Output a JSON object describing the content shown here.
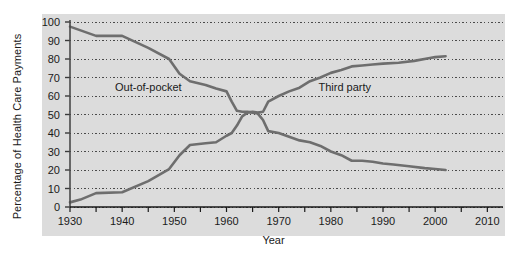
{
  "chart_data": {
    "type": "line",
    "title": "",
    "xlabel": "Year",
    "ylabel": "Percentage of Health Care Payments",
    "xlim": [
      1930,
      2013
    ],
    "ylim": [
      0,
      100
    ],
    "grid": true,
    "legend_position": "inline-annotation",
    "y_ticks": [
      0,
      10,
      20,
      30,
      40,
      50,
      60,
      70,
      80,
      90,
      100
    ],
    "y_tick_labels": [
      "0",
      "10",
      "20",
      "30",
      "40",
      "50",
      "60",
      "70",
      "80",
      "90",
      "100"
    ],
    "x_ticks": [
      1930,
      1935,
      1940,
      1945,
      1950,
      1955,
      1960,
      1965,
      1970,
      1975,
      1980,
      1985,
      1990,
      1995,
      2000,
      2005,
      2010
    ],
    "x_tick_labels_major": [
      "1930",
      "1940",
      "1950",
      "1960",
      "1970",
      "1980",
      "1990",
      "2000",
      "2010"
    ],
    "x_major_values": [
      1930,
      1940,
      1950,
      1960,
      1970,
      1980,
      1990,
      2000,
      2010
    ],
    "series": [
      {
        "name": "Out-of-pocket",
        "color": "#6e6e6e",
        "label_x": 1944,
        "label_y": 65,
        "x": [
          1930,
          1935,
          1940,
          1945,
          1949,
          1951,
          1953,
          1956,
          1958,
          1960,
          1961,
          1962,
          1963,
          1964,
          1965,
          1966,
          1967,
          1968,
          1970,
          1972,
          1974,
          1976,
          1978,
          1980,
          1982,
          1984,
          1986,
          1988,
          1990,
          1992,
          1995,
          1998,
          2000,
          2002
        ],
        "y": [
          97.5,
          92.5,
          92.5,
          86,
          80,
          72,
          68,
          66,
          64,
          62.5,
          57,
          52,
          51.5,
          51.5,
          51,
          50.5,
          47,
          41,
          40,
          38,
          36,
          35,
          33,
          30,
          28,
          25,
          25,
          24.5,
          23.5,
          23,
          22,
          21,
          20.5,
          20
        ]
      },
      {
        "name": "Third party",
        "color": "#6e6e6e",
        "label_x": 1983,
        "label_y": 65,
        "x": [
          1930,
          1932,
          1935,
          1940,
          1945,
          1949,
          1951,
          1953,
          1956,
          1958,
          1960,
          1961,
          1962,
          1963,
          1964,
          1965,
          1966,
          1967,
          1968,
          1970,
          1972,
          1974,
          1976,
          1978,
          1980,
          1982,
          1984,
          1986,
          1988,
          1990,
          1993,
          1996,
          1999,
          2000,
          2002
        ],
        "y": [
          2.5,
          4,
          7.5,
          8,
          14,
          20.5,
          28,
          33.5,
          34.5,
          35,
          38.5,
          40,
          44,
          49,
          51,
          51.5,
          51,
          51.5,
          57,
          60,
          62.5,
          64.5,
          68,
          70,
          72.5,
          74,
          76,
          76.5,
          77,
          77.5,
          78,
          79,
          80.5,
          81,
          81.5
        ]
      }
    ]
  }
}
